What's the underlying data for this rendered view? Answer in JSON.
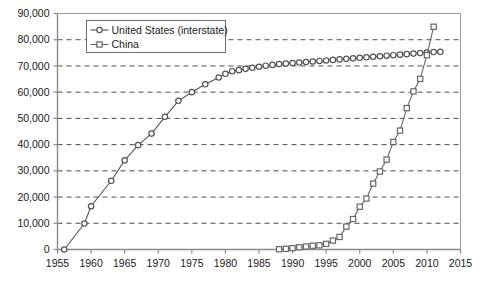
{
  "chart_data": {
    "type": "line",
    "title": "",
    "subtitle": "",
    "xlabel": "",
    "ylabel": "",
    "xlim": [
      1955,
      2015
    ],
    "ylim": [
      0,
      90000
    ],
    "xticks": [
      1955,
      1960,
      1965,
      1970,
      1975,
      1980,
      1985,
      1990,
      1995,
      2000,
      2005,
      2010,
      2015
    ],
    "yticks": [
      0,
      10000,
      20000,
      30000,
      40000,
      50000,
      60000,
      70000,
      80000,
      90000
    ],
    "xtick_labels": [
      "1955",
      "1960",
      "1965",
      "1970",
      "1975",
      "1980",
      "1985",
      "1990",
      "1995",
      "2000",
      "2005",
      "2010",
      "2015"
    ],
    "ytick_labels": [
      "0",
      "10,000",
      "20,000",
      "30,000",
      "40,000",
      "50,000",
      "60,000",
      "70,000",
      "80,000",
      "90,000"
    ],
    "grid": "horizontal-dashed",
    "legend_position": "top-left-inside",
    "series": [
      {
        "name": "United States (interstate)",
        "marker": "circle-open",
        "color": "#555555",
        "points": [
          [
            1956,
            0
          ],
          [
            1959,
            9900
          ],
          [
            1960,
            16500
          ],
          [
            1963,
            26200
          ],
          [
            1965,
            34000
          ],
          [
            1967,
            39800
          ],
          [
            1969,
            44200
          ],
          [
            1971,
            50600
          ],
          [
            1973,
            56700
          ],
          [
            1975,
            60000
          ],
          [
            1977,
            63000
          ],
          [
            1979,
            65600
          ],
          [
            1980,
            67000
          ],
          [
            1981,
            68000
          ],
          [
            1982,
            68400
          ],
          [
            1983,
            68900
          ],
          [
            1984,
            69300
          ],
          [
            1985,
            69700
          ],
          [
            1986,
            70100
          ],
          [
            1987,
            70400
          ],
          [
            1988,
            70700
          ],
          [
            1989,
            70900
          ],
          [
            1990,
            71100
          ],
          [
            1991,
            71300
          ],
          [
            1992,
            71500
          ],
          [
            1993,
            71700
          ],
          [
            1994,
            71900
          ],
          [
            1995,
            72100
          ],
          [
            1996,
            72300
          ],
          [
            1997,
            72500
          ],
          [
            1998,
            72700
          ],
          [
            1999,
            72900
          ],
          [
            2000,
            73100
          ],
          [
            2001,
            73300
          ],
          [
            2002,
            73500
          ],
          [
            2003,
            73700
          ],
          [
            2004,
            73900
          ],
          [
            2005,
            74100
          ],
          [
            2006,
            74300
          ],
          [
            2007,
            74500
          ],
          [
            2008,
            74700
          ],
          [
            2009,
            74900
          ],
          [
            2010,
            75100
          ],
          [
            2011,
            75300
          ],
          [
            2012,
            75400
          ]
        ]
      },
      {
        "name": "China",
        "marker": "square-open",
        "color": "#666666",
        "points": [
          [
            1988,
            100
          ],
          [
            1989,
            270
          ],
          [
            1990,
            520
          ],
          [
            1991,
            840
          ],
          [
            1992,
            1145
          ],
          [
            1993,
            1450
          ],
          [
            1994,
            1600
          ],
          [
            1995,
            2141
          ],
          [
            1996,
            3422
          ],
          [
            1997,
            4771
          ],
          [
            1998,
            8733
          ],
          [
            1999,
            11605
          ],
          [
            2000,
            16314
          ],
          [
            2001,
            19437
          ],
          [
            2002,
            25130
          ],
          [
            2003,
            29745
          ],
          [
            2004,
            34288
          ],
          [
            2005,
            41005
          ],
          [
            2006,
            45339
          ],
          [
            2007,
            53913
          ],
          [
            2008,
            60302
          ],
          [
            2009,
            65065
          ],
          [
            2010,
            74113
          ],
          [
            2011,
            84946
          ]
        ]
      }
    ]
  },
  "legend": {
    "items": [
      {
        "label": "United States (interstate)",
        "marker": "circle-open"
      },
      {
        "label": "China",
        "marker": "square-open"
      }
    ]
  },
  "colors": {
    "series_us": "#555555",
    "series_cn": "#666666",
    "grid": "#4d4d4d",
    "axis": "#8a8a8a",
    "frame": "#9a9a9a",
    "text": "#1a1a1a",
    "background": "#ffffff"
  }
}
